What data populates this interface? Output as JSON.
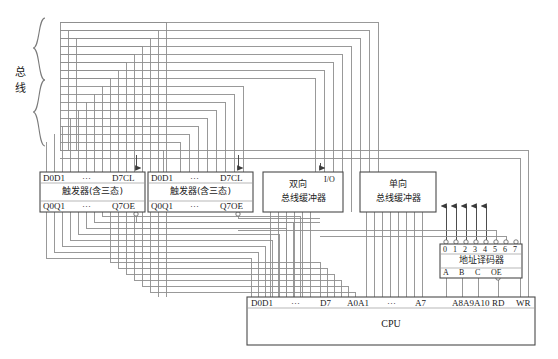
{
  "diagram": {
    "title_label": "总线",
    "bus_label_chars": [
      "总",
      "线"
    ]
  },
  "blocks": {
    "flipflop_left": {
      "name": "flip-flop-latch-left",
      "top_left_pins": "D0D1",
      "top_dots": "···",
      "top_right_pins": "D7CL",
      "body_label": "触发器(含三态)",
      "bottom_left_pins": "Q0Q1",
      "bottom_dots": "···",
      "bottom_right_pins": "Q7OE"
    },
    "flipflop_right": {
      "name": "flip-flop-latch-right",
      "top_left_pins": "D0D1",
      "top_dots": "···",
      "top_right_pins": "D7CL",
      "body_label": "触发器(含三态)",
      "bottom_left_pins": "Q0Q1",
      "bottom_dots": "···",
      "bottom_right_pins": "Q7OE"
    },
    "bidir_buffer": {
      "name": "bidirectional-bus-buffer",
      "line1": "双向",
      "line2": "总线缓冲器",
      "io_label": "I/O"
    },
    "unidir_buffer": {
      "name": "unidirectional-bus-buffer",
      "line1": "单向",
      "line2": "总线缓冲器"
    },
    "address_decoder": {
      "name": "address-decoder",
      "outputs": [
        "0",
        "1",
        "2",
        "3",
        "4",
        "5",
        "6",
        "7"
      ],
      "body_label": "地址译码器",
      "inputs": [
        "A",
        "B",
        "C"
      ],
      "enable": "OE"
    },
    "cpu": {
      "name": "cpu",
      "body_label": "CPU",
      "pins": [
        {
          "text": "D0D1"
        },
        {
          "text": "···"
        },
        {
          "text": "D7"
        },
        {
          "text": "A0A1"
        },
        {
          "text": "···"
        },
        {
          "text": "A7"
        },
        {
          "text": "A8A9A10"
        },
        {
          "text": "RD"
        },
        {
          "text": "WR"
        }
      ]
    }
  },
  "colors": {
    "line": "#8a8a8a",
    "box_border": "#4a4a4a",
    "text": "#1a1a1a",
    "background": "#ffffff"
  }
}
